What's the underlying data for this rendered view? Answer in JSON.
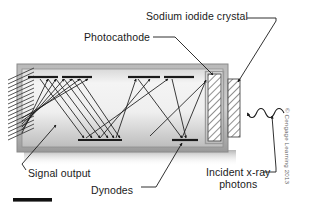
{
  "figure": {
    "title_alt": "Scintillation detector with photomultiplier tube",
    "labels": {
      "sodium_iodide_crystal": "Sodium iodide crystal",
      "photocathode": "Photocathode",
      "signal_output": "Signal output",
      "dynodes": "Dynodes",
      "incident_xray_line1": "Incident x-ray",
      "incident_xray_line2": "photons"
    },
    "credit": "© Cengage Learning 2013",
    "colors": {
      "ink": "#1a1a1a",
      "tube_border": "#7a7a7a",
      "tube_fill_light": "#f2f2f2",
      "tube_fill_dark": "#c9c9c9",
      "hatch": "#2b2b2b",
      "credit_gray": "#666666",
      "scalebar": "#111111"
    },
    "components": {
      "dynodes_count": 10,
      "scale_bar": true
    }
  }
}
